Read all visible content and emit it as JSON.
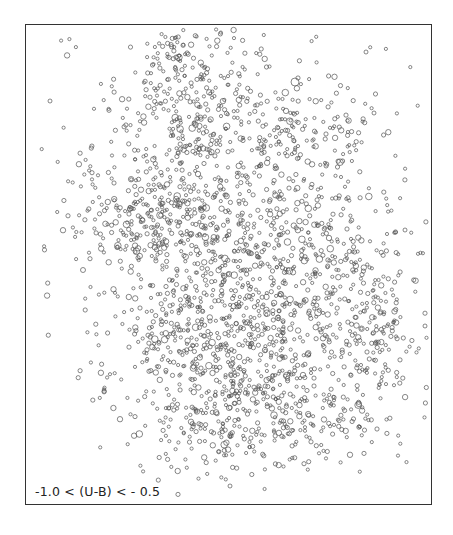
{
  "chart_data": {
    "type": "scatter",
    "title": "",
    "annotation": "-1.0 < (U-B) < - 0.5",
    "xlabel": "",
    "ylabel": "",
    "grid": false,
    "legend": null,
    "marker": "open circle",
    "marker_color": "#555555",
    "frame": {
      "left": 25,
      "top": 24,
      "right": 432,
      "bottom": 505
    },
    "point_count_approx": 2200,
    "density_regions": [
      {
        "name": "upper-center arm",
        "cx": 190,
        "cy": 110,
        "sx": 38,
        "sy": 45,
        "n": 260
      },
      {
        "name": "top spur",
        "cx": 175,
        "cy": 45,
        "sx": 18,
        "sy": 18,
        "n": 40
      },
      {
        "name": "upper-right arm",
        "cx": 290,
        "cy": 140,
        "sx": 45,
        "sy": 35,
        "n": 170
      },
      {
        "name": "left-middle clump",
        "cx": 145,
        "cy": 210,
        "sx": 45,
        "sy": 30,
        "n": 230
      },
      {
        "name": "center",
        "cx": 230,
        "cy": 250,
        "sx": 55,
        "sy": 50,
        "n": 330
      },
      {
        "name": "right-middle",
        "cx": 330,
        "cy": 265,
        "sx": 45,
        "sy": 45,
        "n": 230
      },
      {
        "name": "lower-center",
        "cx": 250,
        "cy": 350,
        "sx": 55,
        "sy": 40,
        "n": 300
      },
      {
        "name": "lower-left",
        "cx": 175,
        "cy": 330,
        "sx": 40,
        "sy": 45,
        "n": 160
      },
      {
        "name": "far-right",
        "cx": 380,
        "cy": 330,
        "sx": 22,
        "sy": 40,
        "n": 90
      },
      {
        "name": "bottom clump",
        "cx": 260,
        "cy": 420,
        "sx": 45,
        "sy": 25,
        "n": 170
      },
      {
        "name": "bottom-right",
        "cx": 340,
        "cy": 405,
        "sx": 40,
        "sy": 30,
        "n": 90
      },
      {
        "name": "bottom-left tail",
        "cx": 190,
        "cy": 430,
        "sx": 25,
        "sy": 25,
        "n": 50
      },
      {
        "name": "diffuse halo",
        "cx": 235,
        "cy": 260,
        "sx": 95,
        "sy": 120,
        "n": 260
      }
    ],
    "isolated_points": [
      {
        "x": 50,
        "y": 101,
        "r": 2
      },
      {
        "x": 83,
        "y": 270,
        "r": 2.5
      },
      {
        "x": 295,
        "y": 82,
        "r": 4
      },
      {
        "x": 366,
        "y": 52,
        "r": 2
      },
      {
        "x": 374,
        "y": 113,
        "r": 2
      },
      {
        "x": 425,
        "y": 326,
        "r": 2
      },
      {
        "x": 405,
        "y": 230,
        "r": 2
      },
      {
        "x": 230,
        "y": 486,
        "r": 2
      }
    ]
  }
}
